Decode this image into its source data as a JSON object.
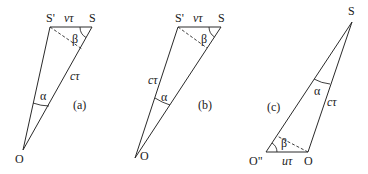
{
  "figure": {
    "panels": [
      {
        "id": "a",
        "caption": "(a)",
        "points": {
          "S_prime": "S'",
          "S": "S",
          "O": "O"
        },
        "labels": {
          "top_side": "vτ",
          "long_side": "cτ",
          "angle_at_O": "α",
          "angle_at_S": "β"
        }
      },
      {
        "id": "b",
        "caption": "(b)",
        "points": {
          "S_prime": "S'",
          "S": "S",
          "O": "O"
        },
        "labels": {
          "top_side": "vτ",
          "long_side": "cτ",
          "angle_at_O": "α",
          "angle_at_S": "β"
        }
      },
      {
        "id": "c",
        "caption": "(c)",
        "points": {
          "S": "S",
          "O_double_prime": "O\"",
          "O": "O"
        },
        "labels": {
          "bottom_side": "uτ",
          "long_side": "cτ",
          "angle_at_S": "α",
          "angle_at_O_double_prime": "β"
        }
      }
    ]
  }
}
